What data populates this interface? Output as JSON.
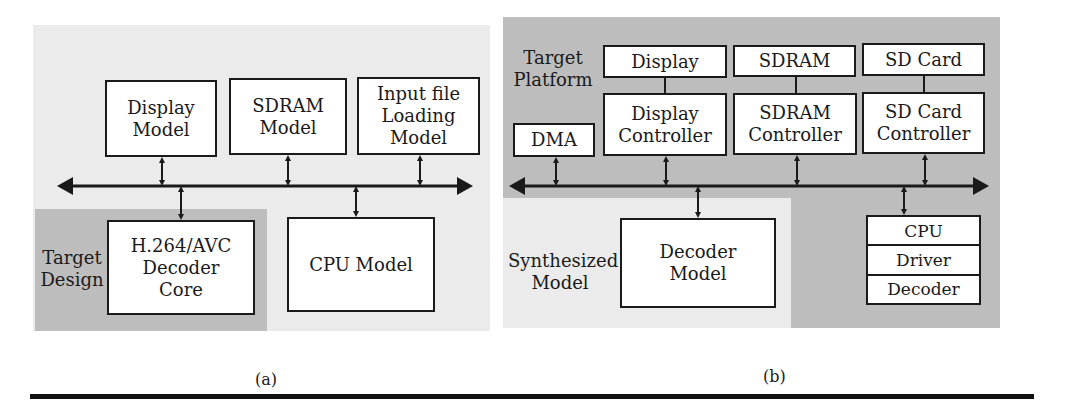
{
  "panel_a": {
    "caption": "(a)",
    "boxes": {
      "display_model": "Display\nModel",
      "sdram_model": "SDRAM\nModel",
      "input_file_model": "Input file\nLoading\nModel",
      "decoder_core": "H.264/AVC\nDecoder\nCore",
      "cpu_model": "CPU Model"
    },
    "region_label": "Target\nDesign"
  },
  "panel_b": {
    "caption": "(b)",
    "region_labels": {
      "target_platform": "Target\nPlatform",
      "synthesized_model": "Synthesized\nModel"
    },
    "boxes": {
      "dma": "DMA",
      "display": "Display",
      "display_controller": "Display\nController",
      "sdram": "SDRAM",
      "sdram_controller": "SDRAM\nController",
      "sd_card": "SD Card",
      "sd_card_controller": "SD Card\nController",
      "decoder_model": "Decoder\nModel"
    },
    "cpu_stack": [
      "CPU",
      "Driver",
      "Decoder"
    ]
  },
  "colors": {
    "light_region": "#ebebeb",
    "dark_region": "#bdbdbd",
    "line": "#1a1a1a"
  }
}
